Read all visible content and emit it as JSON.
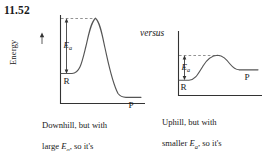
{
  "problem": {
    "number": "11.52"
  },
  "comparison": {
    "connector_label": "versus"
  },
  "axis": {
    "energy_label": "Energy",
    "arrow_direction": "up"
  },
  "diagrams": [
    {
      "id": "downhill",
      "reactant_label": "R",
      "product_label": "P",
      "activation_energy_label": "Ea",
      "activation_energy_symbol": "E",
      "activation_energy_subscript": "a",
      "caption_line1": "Downhill, but with",
      "caption_line2_pre": "large ",
      "caption_line2_post": ", so it's",
      "caption_line3": "slow",
      "caption_full": "Downhill, but with large Ea, so it's slow",
      "reaction_direction": "exothermic",
      "barrier_size": "large",
      "rate": "slow"
    },
    {
      "id": "uphill",
      "reactant_label": "R",
      "product_label": "P",
      "activation_energy_label": "Ea",
      "activation_energy_symbol": "E",
      "activation_energy_subscript": "a",
      "caption_line1": "Uphill, but with",
      "caption_line2_pre": "smaller ",
      "caption_line2_post": ", so it's",
      "caption_line3": "fast",
      "caption_full": "Uphill, but with smaller Ea, so it's fast",
      "reaction_direction": "endothermic",
      "barrier_size": "smaller",
      "rate": "fast"
    }
  ],
  "colors": {
    "ink": "#1a1a1a",
    "curve": "#555555",
    "axis": "#333333",
    "dashed": "#777777",
    "background": "#ffffff"
  }
}
